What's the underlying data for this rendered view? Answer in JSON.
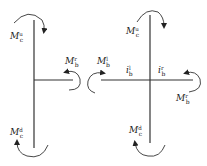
{
  "diagram": {
    "type": "joint-moment-diagram",
    "colors": {
      "line": "#333333",
      "text": "#222222",
      "background": "#ffffff"
    },
    "left_joint": {
      "name": "edge joint",
      "labels": {
        "column_top": {
          "main": "M",
          "sup": "u",
          "sub": "c"
        },
        "beam_right": {
          "main": "M",
          "sup": "r",
          "sub": "b"
        },
        "column_bottom": {
          "main": "M",
          "sup": "d",
          "sub": "c"
        }
      }
    },
    "right_joint": {
      "name": "interior joint",
      "labels": {
        "column_top": {
          "main": "M",
          "sup": "u",
          "sub": "c"
        },
        "beam_left": {
          "main": "M",
          "sup": "l",
          "sub": "b"
        },
        "beam_right": {
          "main": "M",
          "sup": "r",
          "sub": "b"
        },
        "column_bottom": {
          "main": "M",
          "sup": "d",
          "sub": "c"
        },
        "span_left": {
          "main": "i",
          "sup": "l",
          "sub": "b"
        },
        "span_right": {
          "main": "i",
          "sup": "r",
          "sub": "b"
        }
      }
    }
  }
}
